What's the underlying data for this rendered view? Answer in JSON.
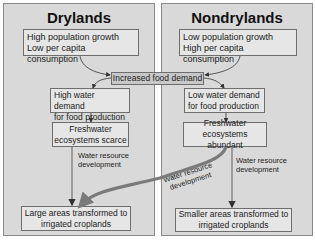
{
  "drylands": {
    "title": "Drylands",
    "driver_line1": "High population growth",
    "driver_line2": "Low per capita consumption",
    "demand_line1": "High water demand",
    "demand_line2": "for food production",
    "ecosystem_line1": "Freshwater",
    "ecosystem_line2": "ecosystems scarce",
    "development_line1": "Water resource",
    "development_line2": "development",
    "outcome_line1": "Large areas transformed to",
    "outcome_line2": "irrigated croplands"
  },
  "nondrylands": {
    "title": "Nondrylands",
    "driver_line1": "Low population growth",
    "driver_line2": "High per capita consumption",
    "demand_line1": "Low water demand",
    "demand_line2": "for food production",
    "ecosystem_line1": "Freshwater",
    "ecosystem_line2": "ecosystems abundant",
    "development_line1": "Water resource",
    "development_line2": "development",
    "outcome_line1": "Smaller areas transformed to",
    "outcome_line2": "irrigated croplands"
  },
  "shared": {
    "food_demand": "Increased food demand",
    "cross_development_line1": "Water resource",
    "cross_development_line2": "development"
  },
  "colors": {
    "panel_bg": "#d9d9d9",
    "box_bg": "#e6e6e6",
    "central_box_bg": "#c8c8c8",
    "cross_arrow": "#7a7a7a"
  }
}
